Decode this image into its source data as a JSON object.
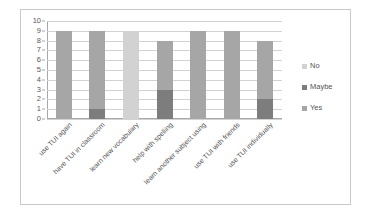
{
  "chart_data": {
    "type": "bar",
    "title": "",
    "subtitle": "",
    "xlabel": "",
    "ylabel": "",
    "ylim": [
      0,
      10
    ],
    "ytick_labels": [
      "0",
      "1",
      "2",
      "3",
      "4",
      "5",
      "6",
      "7",
      "8",
      "9",
      "10"
    ],
    "grid": true,
    "stacked": true,
    "legend_position": "right",
    "categories": [
      "use TUI again",
      "have TUI in classroom",
      "learn new vocabulary",
      "help with spelling",
      "learn another subject using",
      "use TUI with friends",
      "use TUI individually"
    ],
    "series": [
      {
        "name": "No",
        "color": "#d2d2d2",
        "values": [
          0,
          0,
          9,
          0,
          0,
          0,
          0
        ]
      },
      {
        "name": "Maybe",
        "color": "#7d7d7d",
        "values": [
          0,
          1,
          0,
          3,
          0,
          0,
          2
        ]
      },
      {
        "name": "Yes",
        "color": "#a6a6a6",
        "values": [
          9,
          8,
          0,
          5,
          9,
          9,
          6
        ]
      }
    ],
    "totals": [
      9,
      9,
      9,
      8,
      9,
      9,
      8
    ]
  },
  "legend": {
    "items": [
      {
        "label": "No"
      },
      {
        "label": "Maybe"
      },
      {
        "label": "Yes"
      }
    ]
  },
  "colors": {
    "no": "#d2d2d2",
    "maybe": "#7d7d7d",
    "yes": "#a6a6a6",
    "gridline": "#d2d2d2",
    "axis": "#a8a8a8",
    "border": "#c9c9c9",
    "text": "#545454",
    "background": "#ffffff"
  }
}
